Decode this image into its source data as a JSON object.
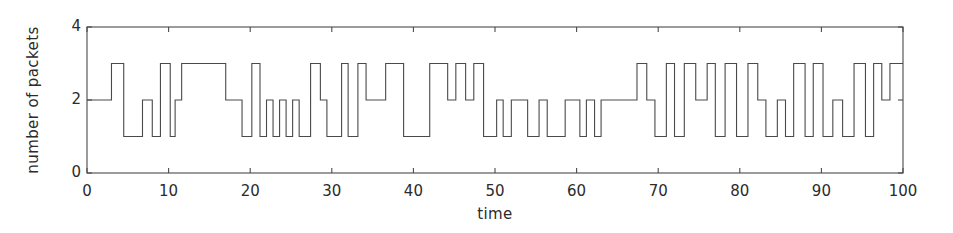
{
  "chart_data": {
    "type": "line",
    "subtype": "step",
    "title": "",
    "xlabel": "time",
    "ylabel": "number of packets",
    "xlim": [
      0,
      100
    ],
    "ylim": [
      0,
      4
    ],
    "xticks": [
      0,
      10,
      20,
      30,
      40,
      50,
      60,
      70,
      80,
      90,
      100
    ],
    "xticklabels": [
      "0",
      "10",
      "20",
      "30",
      "40",
      "50",
      "60",
      "70",
      "80",
      "90",
      "100"
    ],
    "yticks": [
      0,
      2,
      4
    ],
    "yticklabels": [
      "0",
      "2",
      "4"
    ],
    "grid": false,
    "legend": null,
    "line_color": "#4a4a4a",
    "line_width": 1.1,
    "background": "#ffffff",
    "series": [
      {
        "name": "number of packets",
        "step_mode": "post",
        "x": [
          0,
          3,
          4.5,
          6.8,
          8,
          9,
          10.2,
          10.8,
          11.6,
          17,
          19,
          20.2,
          21.2,
          22,
          22.8,
          23.6,
          24.4,
          25.2,
          26,
          27.4,
          28.6,
          29.4,
          31.2,
          32,
          33.2,
          34.2,
          36.6,
          38.8,
          42,
          44.2,
          45.2,
          46.4,
          47.4,
          48.6,
          50.2,
          51,
          52,
          54,
          55.4,
          56.4,
          58.6,
          60.4,
          61.2,
          62.2,
          63,
          67.4,
          68.6,
          69.6,
          71,
          72,
          73.2,
          74.6,
          76,
          77,
          78.2,
          79.6,
          81,
          82.2,
          83.2,
          84.6,
          85.6,
          86.6,
          88,
          89,
          90.2,
          91.4,
          92.6,
          94,
          95.4,
          96.4,
          97.4,
          98.4,
          100
        ],
        "y": [
          2,
          3,
          1,
          2,
          1,
          3,
          1,
          2,
          3,
          2,
          1,
          3,
          1,
          2,
          1,
          2,
          1,
          2,
          1,
          3,
          2,
          1,
          3,
          1,
          3,
          2,
          3,
          1,
          3,
          2,
          3,
          2,
          3,
          1,
          2,
          1,
          2,
          1,
          2,
          1,
          2,
          1,
          2,
          1,
          2,
          3,
          2,
          1,
          3,
          1,
          3,
          2,
          3,
          1,
          3,
          1,
          3,
          2,
          1,
          2,
          1,
          3,
          1,
          3,
          1,
          2,
          1,
          3,
          1,
          3,
          2,
          3,
          3
        ]
      }
    ]
  },
  "axes": {
    "frame_color": "#4a4a4a",
    "tick_color": "#4a4a4a"
  }
}
